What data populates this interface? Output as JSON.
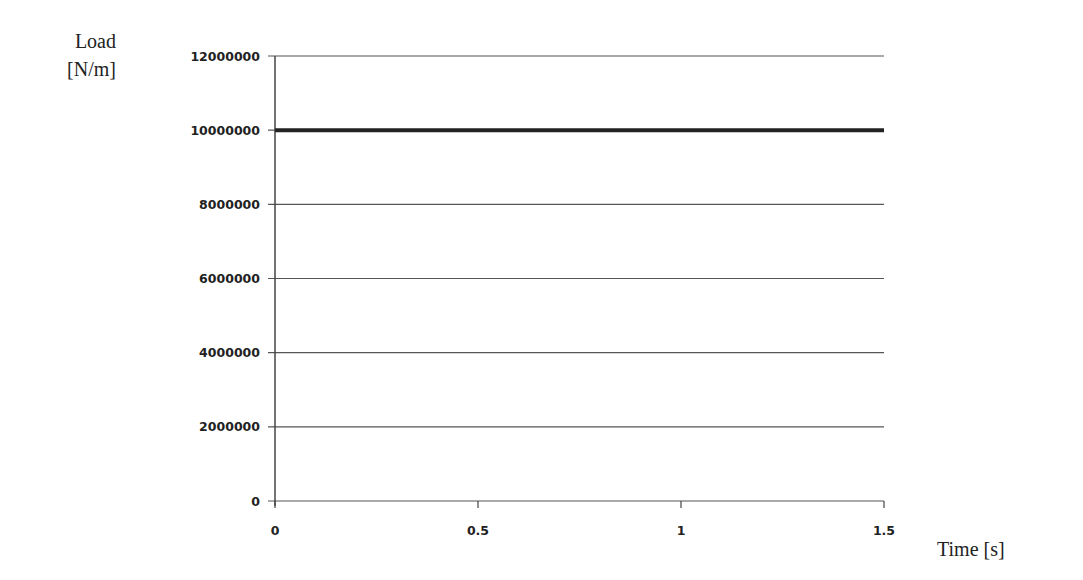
{
  "chart_data": {
    "type": "line",
    "title": "",
    "xlabel": "Time [s]",
    "ylabel": "Load [N/m]",
    "ylabel_lines": [
      "Load",
      "[N/m]"
    ],
    "xlim": [
      0,
      1.5
    ],
    "ylim": [
      0,
      12000000
    ],
    "x_ticks": [
      "0",
      "0.5",
      "1",
      "1.5"
    ],
    "x_tick_values": [
      0,
      0.5,
      1,
      1.5
    ],
    "y_ticks": [
      "0",
      "2000000",
      "4000000",
      "6000000",
      "8000000",
      "10000000",
      "12000000"
    ],
    "y_tick_values": [
      0,
      2000000,
      4000000,
      6000000,
      8000000,
      10000000,
      12000000
    ],
    "grid": {
      "horizontal": true,
      "vertical": false
    },
    "legend": null,
    "series": [
      {
        "name": "Load",
        "x": [
          0,
          1.5
        ],
        "y": [
          10000000,
          10000000
        ],
        "color": "#222222",
        "line_width": 4
      }
    ]
  },
  "colors": {
    "grid": "#555555",
    "series": "#222222",
    "text": "#222222"
  }
}
